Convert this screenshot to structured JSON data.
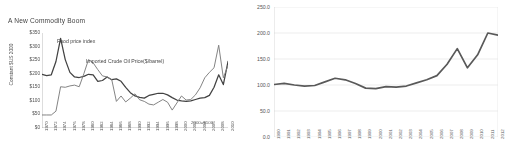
{
  "left_chart": {
    "title": "A New Commodity Boom",
    "ylabel": "Constant $US 2000",
    "base_note": "2000=$100",
    "series_labels": {
      "food": "Food price index",
      "oil": "Imported Crude Oil Price($/barrel)"
    }
  },
  "chart_data": [
    {
      "type": "line",
      "title": "A New Commodity Boom",
      "xlabel": "",
      "ylabel": "Constant $US 2000",
      "ylim": [
        0,
        350
      ],
      "ytick_labels": [
        "$350",
        "$300",
        "$250",
        "$200",
        "$150",
        "$100",
        "$50",
        "$0"
      ],
      "ytick_values": [
        350,
        300,
        250,
        200,
        150,
        100,
        50,
        0
      ],
      "grid": false,
      "legend": "inline-annotations",
      "annotations": [
        "2000=$100"
      ],
      "categories": [
        "1970",
        "1972",
        "1974",
        "1976",
        "1978",
        "1980",
        "1982",
        "1984",
        "1986",
        "1988",
        "1990",
        "1992",
        "1994",
        "1996",
        "1998",
        "2000",
        "2002",
        "2004",
        "2006",
        "2008",
        "2010"
      ],
      "x": [
        1970,
        1971,
        1972,
        1973,
        1974,
        1975,
        1976,
        1977,
        1978,
        1979,
        1980,
        1981,
        1982,
        1983,
        1984,
        1985,
        1986,
        1987,
        1988,
        1989,
        1990,
        1991,
        1992,
        1993,
        1994,
        1995,
        1996,
        1997,
        1998,
        1999,
        2000,
        2001,
        2002,
        2003,
        2004,
        2005,
        2006,
        2007,
        2008,
        2009,
        2010
      ],
      "series": [
        {
          "name": "Food price index",
          "values": [
            198,
            193,
            196,
            245,
            330,
            252,
            205,
            188,
            186,
            190,
            198,
            196,
            172,
            175,
            188,
            178,
            181,
            172,
            150,
            130,
            118,
            113,
            110,
            120,
            124,
            128,
            128,
            122,
            112,
            103,
            100,
            98,
            100,
            105,
            110,
            112,
            120,
            150,
            196,
            160,
            245
          ]
        },
        {
          "name": "Imported Crude Oil Price($/barrel)",
          "values": [
            48,
            48,
            48,
            62,
            152,
            150,
            155,
            158,
            152,
            200,
            252,
            240,
            215,
            192,
            188,
            178,
            98,
            118,
            96,
            110,
            126,
            104,
            98,
            88,
            85,
            95,
            105,
            95,
            66,
            92,
            118,
            103,
            105,
            122,
            148,
            185,
            205,
            222,
            305,
            185,
            230
          ]
        }
      ]
    },
    {
      "type": "line",
      "title": "",
      "xlabel": "",
      "ylabel": "",
      "ylim": [
        0,
        250
      ],
      "ytick_labels": [
        "250.0",
        "200.0",
        "150.0",
        "100.0",
        "50.0",
        "0.0"
      ],
      "ytick_values": [
        250,
        200,
        150,
        100,
        50,
        0
      ],
      "grid": true,
      "legend": "none",
      "categories": [
        "1990",
        "1991",
        "1992",
        "1993",
        "1994",
        "1995",
        "1996",
        "1997",
        "1998",
        "1999",
        "2000",
        "2001",
        "2002",
        "2003",
        "2004",
        "2005",
        "2006",
        "2007",
        "2008",
        "2009",
        "2010",
        "2011",
        "2012"
      ],
      "series": [
        {
          "name": "Index",
          "values": [
            101,
            103,
            100,
            98,
            99,
            106,
            113,
            110,
            103,
            94,
            93,
            97,
            96,
            98,
            104,
            110,
            118,
            140,
            170,
            133,
            158,
            200,
            196
          ]
        }
      ]
    }
  ]
}
